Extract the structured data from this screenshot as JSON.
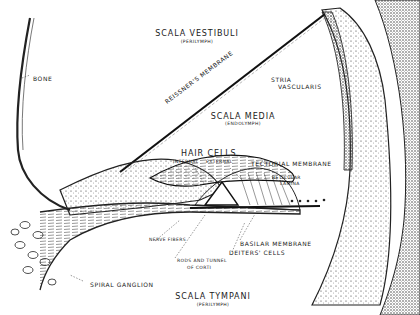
{
  "diagram": {
    "background": "#ffffff",
    "ink": "#1a1a1a",
    "labels": {
      "scala_vestibuli": "SCALA VESTIBULI",
      "scala_vestibuli_sub": "(PERILYMPH)",
      "bone": "BONE",
      "reissners_membrane": "REISSNER'S MEMBRANE",
      "stria_vascularis_1": "STRIA",
      "stria_vascularis_2": "VASCULARIS",
      "scala_media": "SCALA MEDIA",
      "scala_media_sub": "(ENDOLYMPH)",
      "hair_cells": "HAIR CELLS",
      "internal": "INTERNAL",
      "external": "EXTERNAL",
      "tectorial_membrane": "TECTORIAL MEMBRANE",
      "reticular_lamina_1": "RETICULAR",
      "reticular_lamina_2": "LAMINA",
      "nerve_fibers": "NERVE FIBERS",
      "basilar_membrane": "BASILAR MEMBRANE",
      "deiters_cells": "DEITERS' CELLS",
      "rods_tunnel_1": "RODS AND TUNNEL",
      "rods_tunnel_2": "OF CORTI",
      "spiral_ganglion": "SPIRAL GANGLION",
      "scala_tympani": "SCALA TYMPANI",
      "scala_tympani_sub": "(PERILYMPH)"
    }
  }
}
